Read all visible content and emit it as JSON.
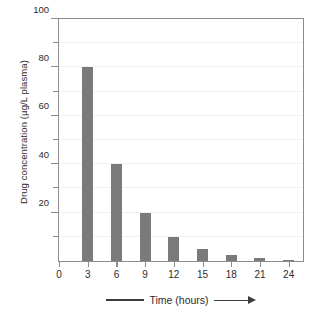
{
  "chart_data": {
    "type": "bar",
    "title": "",
    "subtitle": "",
    "xlabel": "Time (hours)",
    "ylabel": "Drug concentration (µg/L plasma)",
    "categories": [
      "3",
      "6",
      "9",
      "12",
      "15",
      "18",
      "21",
      "24"
    ],
    "values": [
      80,
      40,
      20,
      10,
      5,
      2.5,
      1.25,
      0.6
    ],
    "x_values": [
      3,
      6,
      9,
      12,
      15,
      18,
      21,
      24
    ],
    "xlim": [
      0,
      25.5
    ],
    "ylim": [
      0,
      100
    ],
    "xticks": [
      0,
      3,
      6,
      9,
      12,
      15,
      18,
      21,
      24
    ],
    "xtick_labels": [
      "0",
      "3",
      "6",
      "9",
      "12",
      "15",
      "18",
      "21",
      "24"
    ],
    "yticks": [
      0,
      10,
      20,
      30,
      40,
      50,
      60,
      70,
      80,
      90,
      100
    ],
    "ytick_labels": [
      "",
      "",
      "20",
      "",
      "40",
      "",
      "60",
      "",
      "80",
      "",
      "100"
    ],
    "grid": true,
    "grid_axis": "y",
    "gridline_values": [
      10,
      20,
      30,
      40,
      50,
      60,
      70,
      80,
      90
    ],
    "legend": false,
    "legend_position": "none",
    "bar_color": "#7a7a7a",
    "axis_color": "#8c8c8c",
    "grid_color": "#f0f0f0",
    "background_color": "#ffffff",
    "text_color": "#2b2b2b",
    "annotations": []
  },
  "axis_decoration": {
    "x_arrow": "arrow-right",
    "x_left_rule": "rule"
  }
}
